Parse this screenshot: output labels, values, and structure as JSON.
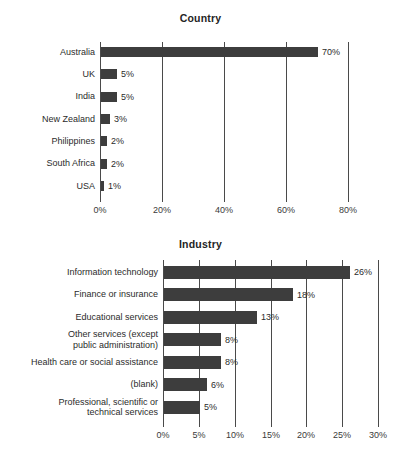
{
  "chart_data": [
    {
      "type": "bar",
      "orientation": "horizontal",
      "title": "Country",
      "xlabel": "",
      "ylabel": "",
      "xlim": [
        0,
        80
      ],
      "xticks": [
        "0%",
        "20%",
        "40%",
        "60%",
        "80%"
      ],
      "xtick_values": [
        0,
        20,
        40,
        60,
        80
      ],
      "grid": true,
      "legend": "none",
      "bar_color": "#3d3d3d",
      "categories": [
        "Australia",
        "UK",
        "India",
        "New Zealand",
        "Philippines",
        "South Africa",
        "USA"
      ],
      "values": [
        70,
        5,
        5,
        3,
        2,
        2,
        1
      ],
      "data_labels": [
        "70%",
        "5%",
        "5%",
        "3%",
        "2%",
        "2%",
        "1%"
      ]
    },
    {
      "type": "bar",
      "orientation": "horizontal",
      "title": "Industry",
      "xlabel": "",
      "ylabel": "",
      "xlim": [
        0,
        30
      ],
      "xticks": [
        "0%",
        "5%",
        "10%",
        "15%",
        "20%",
        "25%",
        "30%"
      ],
      "xtick_values": [
        0,
        5,
        10,
        15,
        20,
        25,
        30
      ],
      "grid": true,
      "legend": "none",
      "bar_color": "#3d3d3d",
      "categories": [
        "Information technology",
        "Finance or insurance",
        "Educational services",
        "Other services (except\npublic administration)",
        "Health care or social assistance",
        "(blank)",
        "Professional, scientific or\ntechnical services"
      ],
      "values": [
        26,
        18,
        13,
        8,
        8,
        6,
        5
      ],
      "data_labels": [
        "26%",
        "18%",
        "13%",
        "8%",
        "8%",
        "6%",
        "5%"
      ]
    }
  ]
}
